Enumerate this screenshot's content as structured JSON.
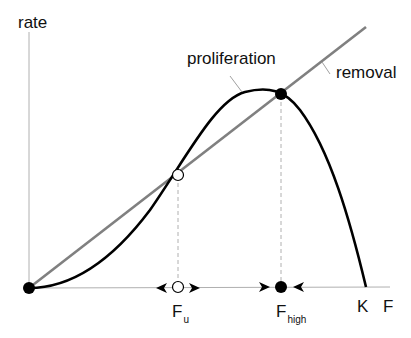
{
  "diagram": {
    "y_axis_label": "rate",
    "x_axis_label": "F",
    "curves": [
      {
        "name": "proliferation",
        "label": "proliferation",
        "color": "#000000",
        "shape": "hump, zero at 0 and K"
      },
      {
        "name": "removal",
        "label": "removal",
        "color": "#808080",
        "shape": "straight line through origin"
      }
    ],
    "fixed_points": [
      {
        "name": "origin",
        "stable": true,
        "fill": "#000000"
      },
      {
        "name": "F_u",
        "label_main": "F",
        "label_sub": "u",
        "stable": false,
        "fill": "#ffffff"
      },
      {
        "name": "F_high",
        "label_main": "F",
        "label_sub": "high",
        "stable": true,
        "fill": "#000000"
      }
    ],
    "k_label": "K",
    "arrows": "flow on F axis: away from F_u, toward F_high"
  }
}
